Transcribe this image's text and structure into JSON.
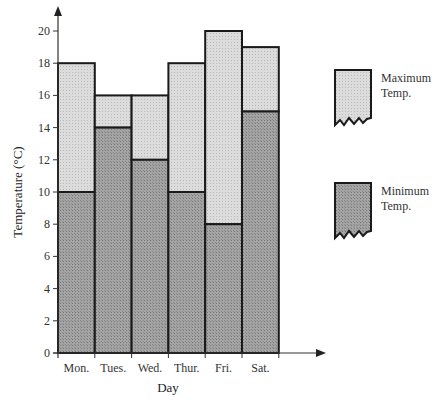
{
  "chart_data": {
    "type": "bar",
    "subtype": "stacked-range",
    "title": "",
    "xlabel": "Day",
    "ylabel": "Temperature (°C)",
    "categories": [
      "Mon.",
      "Tues.",
      "Wed.",
      "Thur.",
      "Fri.",
      "Sat."
    ],
    "series": [
      {
        "name": "Minimum Temp.",
        "values": [
          10,
          14,
          12,
          10,
          8,
          15
        ],
        "color": "#9a9a9a"
      },
      {
        "name": "Maximum Temp.",
        "values": [
          18,
          16,
          16,
          18,
          20,
          19
        ],
        "color": "#d6d6d6"
      }
    ],
    "yticks": [
      0,
      2,
      4,
      6,
      8,
      10,
      12,
      14,
      16,
      18,
      20
    ],
    "ylim": [
      0,
      21
    ],
    "grid": false,
    "legend_position": "right"
  },
  "legend": {
    "max_label_line1": "Maximum",
    "max_label_line2": "Temp.",
    "min_label_line1": "Minimum",
    "min_label_line2": "Temp."
  },
  "axes": {
    "xlabel": "Day",
    "ylabel": "Temperature (°C)"
  }
}
